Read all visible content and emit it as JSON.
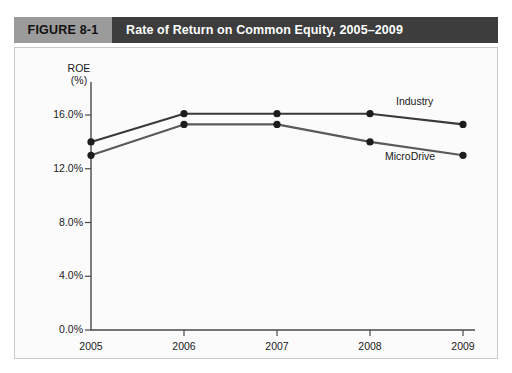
{
  "figure": {
    "number_label": "FIGURE 8-1",
    "title": "Rate of Return on Common Equity, 2005–2009",
    "number_bg": "#9b9b9b",
    "title_bg": "#3d3d3d",
    "title_color": "#ffffff"
  },
  "chart_data": {
    "type": "line",
    "title": "Rate of Return on Common Equity, 2005–2009",
    "xlabel": "",
    "ylabel": "ROE (%)",
    "ylabel_line1": "ROE",
    "ylabel_line2": "(%)",
    "categories": [
      "2005",
      "2006",
      "2007",
      "2008",
      "2009"
    ],
    "x": [
      2005,
      2006,
      2007,
      2008,
      2009
    ],
    "ylim": [
      0.0,
      17.0
    ],
    "yticks": [
      0.0,
      4.0,
      8.0,
      12.0,
      16.0
    ],
    "ytick_labels": [
      "0.0%",
      "4.0%",
      "8.0%",
      "12.0%",
      "16.0%"
    ],
    "xtick_labels": [
      "2005",
      "2006",
      "2007",
      "2008",
      "2009"
    ],
    "grid": false,
    "legend": "inline-annotations",
    "markers": "filled-circle",
    "series": [
      {
        "name": "Industry",
        "color": "#3a3a3a",
        "values": [
          14.0,
          16.1,
          16.1,
          16.1,
          15.3
        ]
      },
      {
        "name": "MicroDrive",
        "color": "#5a5a5a",
        "values": [
          13.0,
          15.3,
          15.3,
          14.0,
          13.0
        ]
      }
    ],
    "annotations": [
      {
        "text": "Industry",
        "series": "Industry"
      },
      {
        "text": "MicroDrive",
        "series": "MicroDrive"
      }
    ]
  }
}
